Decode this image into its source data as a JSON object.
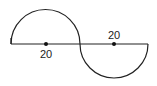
{
  "diagram": {
    "left_semicircle": {
      "direction": "up",
      "diameter_label": "20"
    },
    "right_semicircle": {
      "direction": "down",
      "diameter_label": "20"
    },
    "labels": {
      "left": "20",
      "right": "20"
    },
    "colors": {
      "stroke": "#222222",
      "background": "#ffffff"
    }
  }
}
